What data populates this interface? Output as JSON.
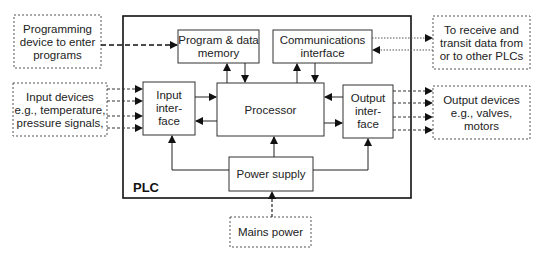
{
  "diagram": {
    "title": "PLC",
    "blocks": {
      "programming_device": {
        "lines": [
          "Programming",
          "device to enter",
          "programs"
        ]
      },
      "input_devices": {
        "lines": [
          "Input devices",
          "e.g., temperature,",
          "pressure signals,"
        ]
      },
      "other_plcs": {
        "lines": [
          "To receive and",
          "transit data from",
          "or to other PLCs"
        ]
      },
      "output_devices": {
        "lines": [
          "Output devices",
          "e.g., valves,",
          "motors"
        ]
      },
      "mains_power": {
        "lines": [
          "Mains power"
        ]
      },
      "memory": {
        "lines": [
          "Program & data",
          "memory"
        ]
      },
      "communications": {
        "lines": [
          "Communications",
          "interface"
        ]
      },
      "input_interface": {
        "lines": [
          "Input",
          "inter-",
          "face"
        ]
      },
      "processor": {
        "lines": [
          "Processor"
        ]
      },
      "output_interface": {
        "lines": [
          "Output",
          "inter-",
          "face"
        ]
      },
      "power_supply": {
        "lines": [
          "Power supply"
        ]
      }
    },
    "colors": {
      "line": "#222222",
      "dashed_line": "#444444",
      "background": "#ffffff"
    }
  }
}
